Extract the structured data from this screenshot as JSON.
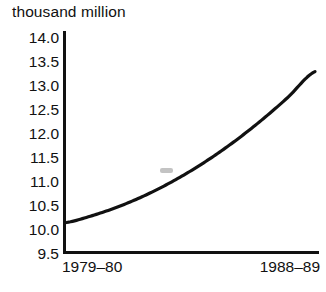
{
  "chart_data": {
    "type": "line",
    "title": "thousand million",
    "subtitle": "",
    "xlabel": "",
    "ylabel": "",
    "ylim": [
      9.5,
      14.0
    ],
    "y_ticks": [
      "14.0",
      "13.5",
      "13.0",
      "12.5",
      "12.0",
      "11.5",
      "11.0",
      "10.5",
      "10.0",
      "9.5"
    ],
    "y_tick_values": [
      14.0,
      13.5,
      13.0,
      12.5,
      12.0,
      11.5,
      11.0,
      10.5,
      10.0,
      9.5
    ],
    "x_ticks": [
      "1979–80",
      "1988–89"
    ],
    "categories": [
      "1979–80",
      "1980–81",
      "1981–82",
      "1982–83",
      "1983–84",
      "1984–85",
      "1985–86",
      "1986–87",
      "1987–88",
      "1988–89"
    ],
    "values": [
      10.15,
      10.3,
      10.5,
      10.75,
      11.05,
      11.4,
      11.8,
      12.25,
      12.75,
      13.3
    ],
    "grid": false,
    "legend": false,
    "legend_position": "none",
    "series": [
      {
        "name": "thousand million",
        "values": [
          10.15,
          10.3,
          10.5,
          10.75,
          11.05,
          11.4,
          11.8,
          12.25,
          12.75,
          13.3
        ]
      }
    ],
    "line_color": "#111111",
    "axis_color": "#111111",
    "background_color": "#ffffff",
    "annotations": []
  },
  "axes": {
    "y_tick_labels": [
      "14.0",
      "13.5",
      "13.0",
      "12.5",
      "12.0",
      "11.5",
      "11.0",
      "10.5",
      "10.0",
      "9.5"
    ],
    "x_tick_labels": {
      "start": "1979–80",
      "end": "1988–89"
    }
  },
  "header": {
    "title": "thousand million"
  }
}
